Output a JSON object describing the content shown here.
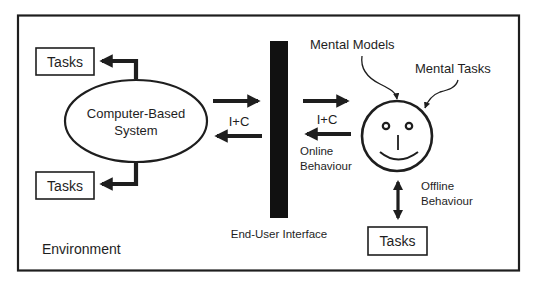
{
  "diagram": {
    "type": "human-computer interaction model",
    "colors": {
      "ink": "#1e1e1e",
      "background": "#ffffff"
    },
    "frame": {
      "label": "Environment"
    },
    "system": {
      "label_line1": "Computer-Based",
      "label_line2": "System",
      "shape": "ellipse"
    },
    "system_tasks": [
      {
        "label": "Tasks",
        "position": "top-left"
      },
      {
        "label": "Tasks",
        "position": "bottom-left"
      }
    ],
    "interface": {
      "label": "End-User Interface",
      "shape": "vertical-bar"
    },
    "flows": [
      {
        "label": "I+C",
        "between": "system-interface",
        "directions": [
          "right",
          "left"
        ]
      },
      {
        "label": "I+C",
        "between": "interface-user",
        "directions": [
          "right",
          "left"
        ]
      }
    ],
    "online_behaviour": {
      "line1": "Online",
      "line2": "Behaviour"
    },
    "user": {
      "shape": "smiley-face",
      "influences": [
        {
          "label": "Mental Models"
        },
        {
          "label": "Mental Tasks"
        }
      ]
    },
    "offline_behaviour": {
      "line1": "Offline",
      "line2": "Behaviour"
    },
    "user_tasks": {
      "label": "Tasks"
    },
    "icons": {
      "right_arrow": "arrow-right-icon",
      "left_arrow": "arrow-left-icon",
      "double_arrow": "arrow-up-down-icon",
      "elbow_arrow": "elbow-arrow-icon",
      "curved_arrow": "curved-arrow-icon"
    }
  }
}
